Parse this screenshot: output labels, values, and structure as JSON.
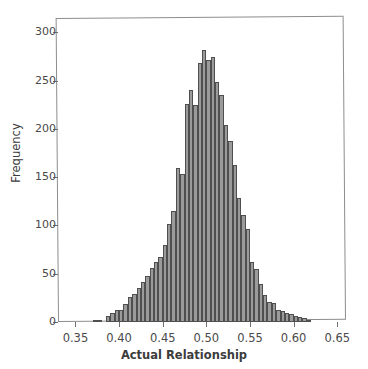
{
  "chart_data": {
    "type": "bar",
    "subtype": "histogram",
    "title": "",
    "xlabel": "Actual Relationship",
    "ylabel": "Frequency",
    "xlim": [
      0.33,
      0.66
    ],
    "ylim": [
      0,
      315
    ],
    "xticks": [
      0.35,
      0.4,
      0.45,
      0.5,
      0.55,
      0.6,
      0.65
    ],
    "xtick_labels": [
      "0.35",
      "0.40",
      "0.45",
      "0.50",
      "0.55",
      "0.60",
      "0.65"
    ],
    "yticks": [
      0,
      50,
      100,
      150,
      200,
      250,
      300
    ],
    "ytick_labels": [
      "0",
      "50",
      "100",
      "150",
      "200",
      "250",
      "300"
    ],
    "grid": false,
    "legend": null,
    "bin_width": 0.005,
    "bar_fill_color": "#9b9b9b",
    "bar_edge_color": "#4f4f4f",
    "frame_color": "#8d8d8d",
    "bins": [
      {
        "x": 0.3725,
        "value": 2
      },
      {
        "x": 0.3775,
        "value": 2
      },
      {
        "x": 0.3825,
        "value": 0
      },
      {
        "x": 0.3875,
        "value": 6
      },
      {
        "x": 0.3925,
        "value": 9
      },
      {
        "x": 0.3975,
        "value": 12
      },
      {
        "x": 0.4025,
        "value": 12
      },
      {
        "x": 0.4075,
        "value": 19
      },
      {
        "x": 0.4125,
        "value": 26
      },
      {
        "x": 0.4175,
        "value": 29
      },
      {
        "x": 0.4225,
        "value": 35
      },
      {
        "x": 0.4275,
        "value": 41
      },
      {
        "x": 0.4325,
        "value": 48
      },
      {
        "x": 0.4375,
        "value": 56
      },
      {
        "x": 0.4425,
        "value": 62
      },
      {
        "x": 0.4475,
        "value": 67
      },
      {
        "x": 0.4525,
        "value": 80
      },
      {
        "x": 0.4575,
        "value": 102
      },
      {
        "x": 0.4625,
        "value": 115
      },
      {
        "x": 0.4675,
        "value": 160
      },
      {
        "x": 0.4725,
        "value": 153
      },
      {
        "x": 0.4775,
        "value": 226
      },
      {
        "x": 0.4825,
        "value": 240
      },
      {
        "x": 0.4875,
        "value": 225
      },
      {
        "x": 0.4925,
        "value": 268
      },
      {
        "x": 0.4975,
        "value": 282
      },
      {
        "x": 0.5025,
        "value": 271
      },
      {
        "x": 0.5075,
        "value": 275
      },
      {
        "x": 0.5125,
        "value": 249
      },
      {
        "x": 0.5175,
        "value": 235
      },
      {
        "x": 0.5225,
        "value": 204
      },
      {
        "x": 0.5275,
        "value": 188
      },
      {
        "x": 0.5325,
        "value": 163
      },
      {
        "x": 0.5375,
        "value": 129
      },
      {
        "x": 0.5425,
        "value": 111
      },
      {
        "x": 0.5475,
        "value": 96
      },
      {
        "x": 0.5525,
        "value": 62
      },
      {
        "x": 0.5575,
        "value": 55
      },
      {
        "x": 0.5625,
        "value": 39
      },
      {
        "x": 0.5675,
        "value": 28
      },
      {
        "x": 0.5725,
        "value": 21
      },
      {
        "x": 0.5775,
        "value": 20
      },
      {
        "x": 0.5825,
        "value": 12
      },
      {
        "x": 0.5875,
        "value": 11
      },
      {
        "x": 0.5925,
        "value": 9
      },
      {
        "x": 0.5975,
        "value": 8
      },
      {
        "x": 0.6025,
        "value": 6
      },
      {
        "x": 0.6075,
        "value": 5
      },
      {
        "x": 0.6125,
        "value": 4
      },
      {
        "x": 0.6175,
        "value": 2
      }
    ]
  },
  "axes": {
    "x_axis_label": "Actual Relationship",
    "y_axis_label": "Frequency"
  }
}
